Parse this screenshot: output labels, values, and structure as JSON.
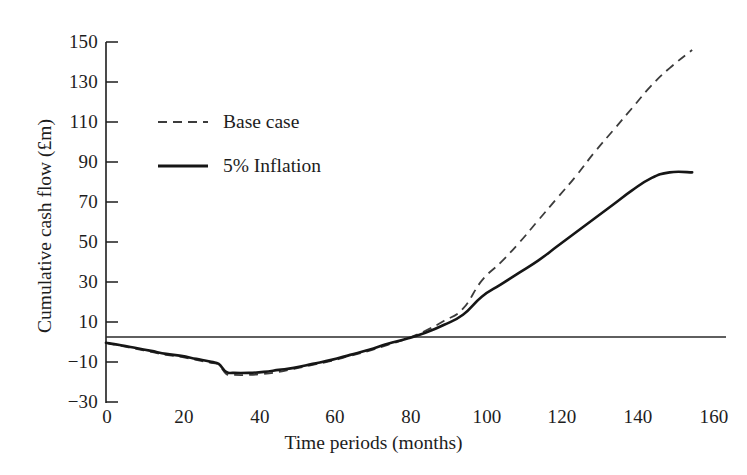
{
  "chart_data": {
    "type": "line",
    "title": "",
    "xlabel": "Time periods (months)",
    "ylabel": "Cumulative cash flow (£m)",
    "xlim": [
      0,
      165
    ],
    "ylim": [
      -30,
      150
    ],
    "xticks": [
      0,
      20,
      40,
      60,
      80,
      100,
      120,
      140,
      160
    ],
    "yticks": [
      -30,
      -10,
      10,
      30,
      50,
      70,
      90,
      110,
      130,
      150
    ],
    "grid": false,
    "zero_line": true,
    "legend_position": "upper-left-inside",
    "series": [
      {
        "name": "Base case",
        "style": "dashed",
        "color": "#3c3c3c",
        "x": [
          0,
          4,
          8,
          12,
          16,
          20,
          24,
          28,
          30,
          32,
          34,
          38,
          42,
          46,
          50,
          55,
          60,
          65,
          70,
          75,
          80,
          85,
          90,
          95,
          100,
          105,
          110,
          115,
          120,
          125,
          130,
          135,
          140,
          145,
          150,
          156
        ],
        "y": [
          0,
          -1.5,
          -3,
          -4.5,
          -6,
          -7,
          -8.5,
          -10,
          -11,
          -15.5,
          -16,
          -16,
          -15.5,
          -14.5,
          -13,
          -11,
          -9,
          -6.5,
          -4,
          -1,
          2,
          6,
          11,
          17,
          31,
          40,
          50,
          61,
          72,
          83,
          95,
          106,
          117,
          128,
          137,
          146
        ]
      },
      {
        "name": "5% Inflation",
        "style": "solid",
        "color": "#161616",
        "x": [
          0,
          4,
          8,
          12,
          16,
          20,
          24,
          28,
          30,
          32,
          34,
          38,
          42,
          46,
          50,
          55,
          60,
          65,
          70,
          75,
          80,
          85,
          90,
          95,
          100,
          105,
          110,
          115,
          120,
          125,
          130,
          135,
          140,
          145,
          150,
          156
        ],
        "y": [
          0,
          -1.2,
          -2.6,
          -4,
          -5.5,
          -6.5,
          -8,
          -9.5,
          -10.5,
          -14.5,
          -15,
          -15,
          -14.5,
          -13.5,
          -12.5,
          -10.5,
          -8.5,
          -6,
          -3.5,
          -0.5,
          2,
          5,
          9,
          14,
          23,
          29,
          35,
          41,
          48,
          55,
          62,
          69,
          76,
          82,
          85,
          85
        ]
      }
    ]
  },
  "axes": {
    "y_tick_labels": [
      "150",
      "130",
      "110",
      "90",
      "70",
      "50",
      "30",
      "10",
      "−10",
      "−30"
    ],
    "x_tick_labels": [
      "0",
      "20",
      "40",
      "60",
      "80",
      "100",
      "120",
      "140",
      "160"
    ],
    "y_axis_label": "Cumulative cash flow (£m)",
    "x_axis_label": "Time periods (months)"
  },
  "legend": {
    "items": [
      {
        "label": "Base case",
        "style": "dashed"
      },
      {
        "label": "5% Inflation",
        "style": "solid"
      }
    ]
  },
  "colors": {
    "axis": "#1d1d1d",
    "base_case": "#3c3c3c",
    "inflation": "#161616",
    "background": "#ffffff"
  }
}
